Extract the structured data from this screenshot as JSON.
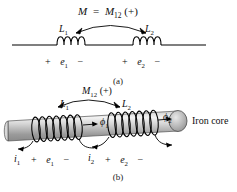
{
  "figure": {
    "background_color": "#ffffff",
    "ink_color": "#101010",
    "core_color": "#b9b9b9"
  },
  "panel_a": {
    "caption": "(a)",
    "mutual_label": {
      "m": "M",
      "equals": "=",
      "m12": "M",
      "m12_sub": "12",
      "sign": "(+)"
    },
    "inductors": [
      {
        "name": "L",
        "sub": "1",
        "loops": 4
      },
      {
        "name": "L",
        "sub": "2",
        "loops": 4
      }
    ],
    "polarity": [
      {
        "plus": "+",
        "voltage": "e",
        "voltage_sub": "1",
        "minus": "−"
      },
      {
        "plus": "+",
        "voltage": "e",
        "voltage_sub": "2",
        "minus": "−"
      }
    ]
  },
  "panel_b": {
    "caption": "(b)",
    "mutual_label": {
      "m12": "M",
      "m12_sub": "12",
      "sign": "(+)"
    },
    "inductors": [
      {
        "name": "L",
        "sub": "1",
        "turns": 8
      },
      {
        "name": "L",
        "sub": "2",
        "turns": 8
      }
    ],
    "flux": [
      {
        "symbol": "ϕ",
        "sub": "1"
      },
      {
        "symbol": "ϕ",
        "sub": "2"
      }
    ],
    "currents": [
      {
        "symbol": "i",
        "sub": "1"
      },
      {
        "symbol": "i",
        "sub": "2"
      }
    ],
    "polarity": [
      {
        "plus": "+",
        "voltage": "e",
        "voltage_sub": "1",
        "minus": "−"
      },
      {
        "plus": "+",
        "voltage": "e",
        "voltage_sub": "2",
        "minus": "−"
      }
    ],
    "core_label": "Iron core"
  }
}
